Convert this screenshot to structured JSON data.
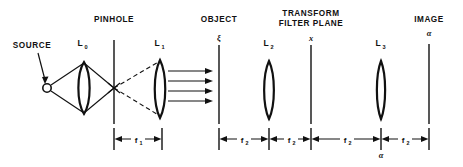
{
  "figure": {
    "title_absent": true,
    "background_color": "#ffffff",
    "ink_color": "#111111",
    "width": 463,
    "height": 167
  },
  "headers": [
    {
      "id": "pinhole",
      "label": "PINHOLE",
      "x": 114,
      "y": 22
    },
    {
      "id": "object",
      "label": "OBJECT",
      "x": 219,
      "y": 22
    },
    {
      "id": "transform",
      "label": "TRANSFORM",
      "x": 311,
      "y": 16
    },
    {
      "id": "filter",
      "label": "FILTER PLANE",
      "x": 311,
      "y": 26
    },
    {
      "id": "image",
      "label": "IMAGE",
      "x": 429,
      "y": 22
    }
  ],
  "source": {
    "label": "SOURCE",
    "label_x": 32,
    "label_y": 48,
    "point_x": 47,
    "point_y": 88,
    "marker": "open-circle"
  },
  "lenses": [
    {
      "id": "L0",
      "label": "L",
      "subscript": "0",
      "x": 84,
      "cy": 88,
      "half_height": 26,
      "half_width": 7.5,
      "label_x": 84,
      "label_y": 46
    },
    {
      "id": "L1",
      "label": "L",
      "subscript": "1",
      "x": 160,
      "cy": 88,
      "half_height": 28,
      "half_width": 7.0,
      "label_x": 160,
      "label_y": 46
    },
    {
      "id": "L2",
      "label": "L",
      "subscript": "2",
      "x": 269,
      "cy": 89,
      "half_height": 28,
      "half_width": 6.5,
      "label_x": 269,
      "label_y": 46
    },
    {
      "id": "L3",
      "label": "L",
      "subscript": "3",
      "x": 381,
      "cy": 89,
      "half_height": 28,
      "half_width": 5.5,
      "label_x": 381,
      "label_y": 46
    }
  ],
  "planes": [
    {
      "id": "pinhole-plane",
      "axis_label": "",
      "x": 114,
      "y_top": 40,
      "y_bottom": 124
    },
    {
      "id": "object-plane",
      "axis_label": "ξ",
      "x": 219,
      "y_top": 44,
      "y_bottom": 124,
      "label_x": 219,
      "label_y": 40
    },
    {
      "id": "filter-plane",
      "axis_label": "x",
      "x": 311,
      "y_top": 44,
      "y_bottom": 124,
      "label_x": 311,
      "label_y": 40
    },
    {
      "id": "image-plane",
      "axis_label": "α",
      "x": 429,
      "y_top": 44,
      "y_bottom": 124,
      "label_x": 429,
      "label_y": 36
    }
  ],
  "ray_bundle": {
    "count": 4,
    "description": "collimated parallel rays from L1 to object plane",
    "y_values": [
      71,
      81,
      91,
      101
    ],
    "x_start": 168,
    "x_end": 213
  },
  "dimensions": [
    {
      "id": "f1-pinhole-to-L1",
      "label": "f",
      "subscript": "1",
      "x_start": 114,
      "x_end": 162,
      "y": 139,
      "label_x": 138,
      "label_y": 142
    },
    {
      "id": "f2-object-to-L2",
      "label": "f",
      "subscript": "2",
      "x_start": 219,
      "x_end": 269,
      "y": 139,
      "label_x": 244,
      "label_y": 142
    },
    {
      "id": "f2-L2-to-filter",
      "label": "f",
      "subscript": "2",
      "x_start": 269,
      "x_end": 311,
      "y": 139,
      "label_x": 290,
      "label_y": 142
    },
    {
      "id": "f2-filter-to-L3",
      "label": "f",
      "subscript": "2",
      "x_start": 311,
      "x_end": 381,
      "y": 139,
      "label_x": 346,
      "label_y": 142
    },
    {
      "id": "f2-L3-to-image",
      "label": "f",
      "subscript": "2",
      "x_start": 381,
      "x_end": 429,
      "y": 139,
      "label_x": 405,
      "label_y": 142
    }
  ],
  "annotations": [
    {
      "id": "alpha-under-L3",
      "label": "α",
      "x": 381,
      "y": 155
    }
  ]
}
